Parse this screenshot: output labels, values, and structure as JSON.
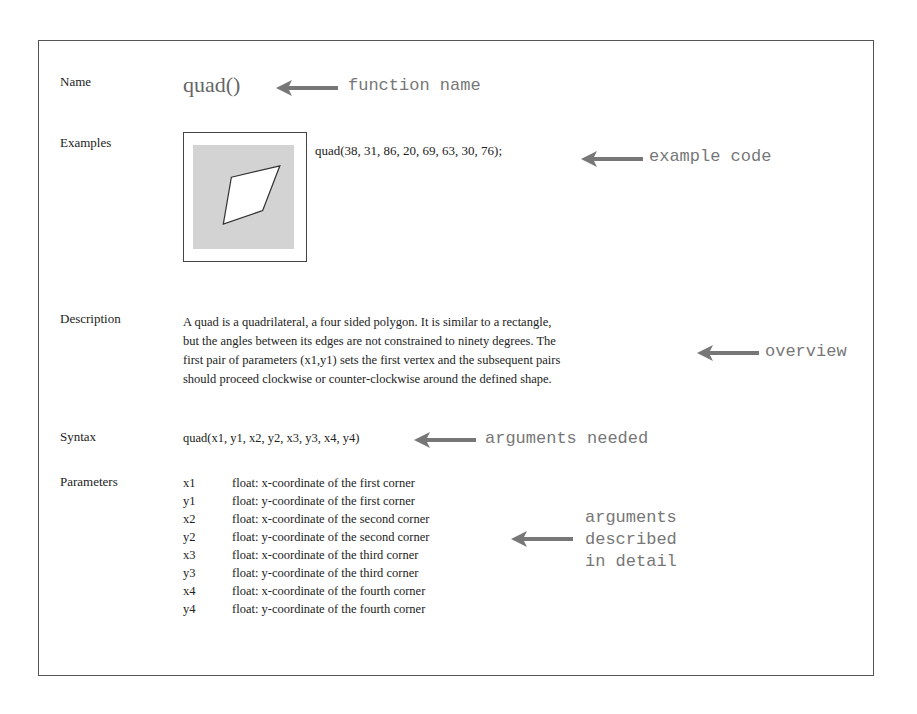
{
  "labels": {
    "name": "Name",
    "examples": "Examples",
    "description": "Description",
    "syntax": "Syntax",
    "parameters": "Parameters"
  },
  "function_name": "quad()",
  "example": {
    "code": "quad(38, 31, 86, 20, 69, 63, 30, 76);",
    "canvas_color": "#d3d3d3",
    "quad_points": [
      [
        38,
        31
      ],
      [
        86,
        20
      ],
      [
        69,
        63
      ],
      [
        30,
        76
      ]
    ]
  },
  "description_lines": [
    "A quad is a quadrilateral, a four sided polygon. It is similar to a rectangle,",
    "but the angles between its edges are not constrained to ninety degrees. The",
    "first pair of parameters (x1,y1) sets the first vertex and the subsequent pairs",
    "should proceed clockwise or counter-clockwise around the defined shape."
  ],
  "syntax": "quad(x1, y1, x2, y2, x3, y3, x4, y4)",
  "parameters": [
    {
      "name": "x1",
      "desc": "float: x-coordinate of the first corner"
    },
    {
      "name": "y1",
      "desc": "float: y-coordinate of the first corner"
    },
    {
      "name": "x2",
      "desc": "float: x-coordinate of the second corner"
    },
    {
      "name": "y2",
      "desc": "float: y-coordinate of the second corner"
    },
    {
      "name": "x3",
      "desc": "float: x-coordinate of the third corner"
    },
    {
      "name": "y3",
      "desc": "float: y-coordinate of the third corner"
    },
    {
      "name": "x4",
      "desc": "float: x-coordinate of the fourth corner"
    },
    {
      "name": "y4",
      "desc": "float: y-coordinate of the fourth corner"
    }
  ],
  "annotations": {
    "function_name": "function name",
    "example_code": "example code",
    "overview": "overview",
    "arguments_needed": "arguments needed",
    "arguments_detail": "arguments\ndescribed\nin detail"
  },
  "colors": {
    "annotation": "#777777",
    "text": "#222222",
    "frame": "#555555"
  }
}
